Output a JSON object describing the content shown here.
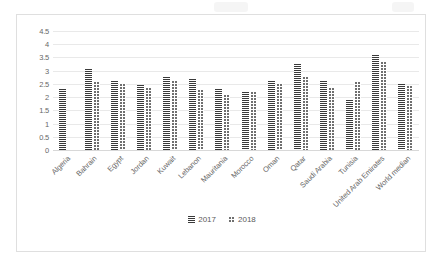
{
  "chart_data": {
    "type": "bar",
    "title": "",
    "xlabel": "",
    "ylabel": "",
    "ylim": [
      0,
      4.5
    ],
    "yticks": [
      "0",
      "0.5",
      "1",
      "1.5",
      "2",
      "2.5",
      "3",
      "3.5",
      "4",
      "4.5"
    ],
    "grid": true,
    "legend_position": "bottom",
    "categories": [
      "Algeria",
      "Bahrain",
      "Egypt",
      "Jordan",
      "Kuwait",
      "Lebanon",
      "Mauritania",
      "Morocco",
      "Oman",
      "Qatar",
      "Saudi Arabia",
      "Tunisia",
      "United Arab Emirates",
      "World median"
    ],
    "series": [
      {
        "name": "2017",
        "values": [
          2.3,
          3.05,
          2.6,
          2.45,
          2.75,
          2.7,
          2.3,
          2.2,
          2.6,
          3.25,
          2.6,
          1.9,
          3.6,
          2.5
        ]
      },
      {
        "name": "2018",
        "values": [
          null,
          2.6,
          2.55,
          2.4,
          2.65,
          2.3,
          2.1,
          2.25,
          2.55,
          2.8,
          2.4,
          2.6,
          3.35,
          2.45
        ]
      }
    ]
  },
  "legend": {
    "items": [
      {
        "label": "2017",
        "key": "s2017"
      },
      {
        "label": "2018",
        "key": "s2018"
      }
    ]
  }
}
